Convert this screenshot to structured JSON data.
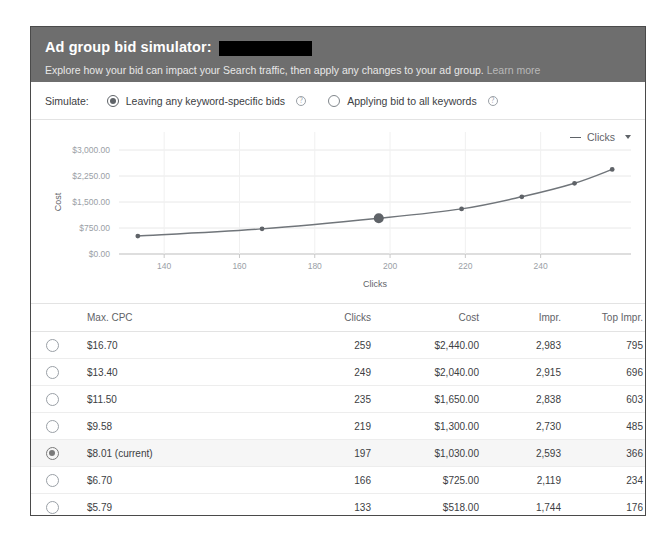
{
  "dialog": {
    "title": "Ad group bid simulator:",
    "redacted_name": "",
    "subtitle": "Explore how your bid can impact your Search traffic, then apply any changes to your ad group.",
    "learn_more": "Learn more"
  },
  "simulate": {
    "label": "Simulate:",
    "options": [
      {
        "label": "Leaving any keyword-specific bids",
        "selected": true,
        "help": "?"
      },
      {
        "label": "Applying bid to all keywords",
        "selected": false,
        "help": "?"
      }
    ]
  },
  "chart_legend": {
    "metric": "Clicks",
    "caret": "chevron-down-icon"
  },
  "chart_data": {
    "type": "line",
    "title": "",
    "xlabel": "Clicks",
    "ylabel": "Cost",
    "x": [
      133,
      166,
      197,
      219,
      235,
      249,
      259
    ],
    "values": [
      518.0,
      725.0,
      1030.0,
      1300.0,
      1650.0,
      2040.0,
      2440.0
    ],
    "series": [
      {
        "name": "Cost",
        "values": [
          518.0,
          725.0,
          1030.0,
          1300.0,
          1650.0,
          2040.0,
          2440.0
        ]
      }
    ],
    "highlighted_index": 2,
    "xlim": [
      128,
      264
    ],
    "ylim": [
      0,
      3000
    ],
    "xticks": [
      140,
      160,
      180,
      200,
      220,
      240
    ],
    "xtick_labels": [
      "140",
      "160",
      "180",
      "200",
      "220",
      "240"
    ],
    "yticks": [
      0,
      750,
      1500,
      2250,
      3000
    ],
    "ytick_labels": [
      "$0.00",
      "$750.00",
      "$1,500.00",
      "$2,250.00",
      "$3,000.00"
    ],
    "grid": true,
    "legend_position": "top-right",
    "line_color": "#70757a",
    "marker_color": "#5f6368"
  },
  "table": {
    "headers": [
      "Max. CPC",
      "Clicks",
      "Cost",
      "Impr.",
      "Top Impr.",
      "Conv."
    ],
    "rows": [
      {
        "selected": false,
        "cpc": "$16.70",
        "clicks": "259",
        "cost": "$2,440.00",
        "impr": "2,983",
        "top_impr": "795",
        "conv": "15"
      },
      {
        "selected": false,
        "cpc": "$13.40",
        "clicks": "249",
        "cost": "$2,040.00",
        "impr": "2,915",
        "top_impr": "696",
        "conv": "15"
      },
      {
        "selected": false,
        "cpc": "$11.50",
        "clicks": "235",
        "cost": "$1,650.00",
        "impr": "2,838",
        "top_impr": "603",
        "conv": "14"
      },
      {
        "selected": false,
        "cpc": "$9.58",
        "clicks": "219",
        "cost": "$1,300.00",
        "impr": "2,730",
        "top_impr": "485",
        "conv": "13"
      },
      {
        "selected": true,
        "cpc": "$8.01 (current)",
        "clicks": "197",
        "cost": "$1,030.00",
        "impr": "2,593",
        "top_impr": "366",
        "conv": "12"
      },
      {
        "selected": false,
        "cpc": "$6.70",
        "clicks": "166",
        "cost": "$725.00",
        "impr": "2,119",
        "top_impr": "234",
        "conv": "10"
      },
      {
        "selected": false,
        "cpc": "$5.79",
        "clicks": "133",
        "cost": "$518.00",
        "impr": "1,744",
        "top_impr": "176",
        "conv": "9"
      }
    ],
    "custom_bid": {
      "currency": "$",
      "placeholder": "Set a different bid",
      "value": "",
      "selected": false
    }
  },
  "colors": {
    "header_bg": "#6e6e6e",
    "dialog_border": "#4a4a4a",
    "selected_row": "#f6f6f6",
    "text": "#3c4043",
    "muted": "#9aa0a6"
  }
}
